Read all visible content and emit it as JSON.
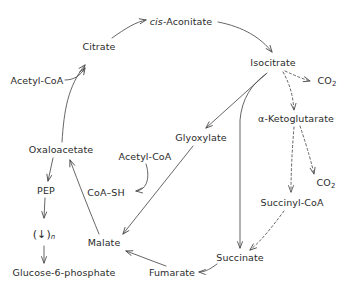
{
  "diagram": {
    "stroke_color": "#4a4a4a",
    "text_color": "#2b2b2b",
    "background_color": "#ffffff",
    "nodes": [
      {
        "id": "cis-aconitate",
        "label_prefix": "cis",
        "label": "-Aconitate",
        "x": 181,
        "y": 22
      },
      {
        "id": "citrate",
        "label": "Citrate",
        "x": 99,
        "y": 47
      },
      {
        "id": "isocitrate",
        "label": "Isocitrate",
        "x": 273,
        "y": 63
      },
      {
        "id": "acetyl-coa-top",
        "label": "Acetyl-CoA",
        "x": 37,
        "y": 81
      },
      {
        "id": "co2-top",
        "label": "CO",
        "sub": "2",
        "x": 327,
        "y": 82
      },
      {
        "id": "alpha-ketoglutarate",
        "label": "α-Ketoglutarate",
        "x": 296,
        "y": 119
      },
      {
        "id": "glyoxylate",
        "label": "Glyoxylate",
        "x": 201,
        "y": 138
      },
      {
        "id": "oxaloacetate",
        "label": "Oxaloacetate",
        "x": 61,
        "y": 150
      },
      {
        "id": "acetyl-coa-mid",
        "label": "Acetyl-CoA",
        "x": 145,
        "y": 157
      },
      {
        "id": "co2-bottom",
        "label": "CO",
        "sub": "2",
        "x": 326,
        "y": 184
      },
      {
        "id": "pep",
        "label": "PEP",
        "x": 46,
        "y": 191
      },
      {
        "id": "coa-sh",
        "label": "CoA–SH",
        "x": 106,
        "y": 193
      },
      {
        "id": "succinyl-coa",
        "label": "Succinyl-CoA",
        "x": 292,
        "y": 203
      },
      {
        "id": "repeat-steps",
        "label": "(↓)",
        "nsub": "n",
        "x": 44,
        "y": 235
      },
      {
        "id": "malate",
        "label": "Malate",
        "x": 104,
        "y": 243
      },
      {
        "id": "succinate",
        "label": "Succinate",
        "x": 240,
        "y": 258
      },
      {
        "id": "fumarate",
        "label": "Fumarate",
        "x": 172,
        "y": 273
      },
      {
        "id": "glucose-6-phosphate",
        "label": "Glucose-6-phosphate",
        "x": 64,
        "y": 273
      }
    ],
    "edges": [
      {
        "id": "citrate-to-cis-aconitate",
        "style": "solid",
        "from": "citrate",
        "to": "cis-aconitate"
      },
      {
        "id": "cis-aconitate-to-isocitrate",
        "style": "solid",
        "from": "cis-aconitate",
        "to": "isocitrate"
      },
      {
        "id": "oxaloacetate-to-citrate",
        "style": "solid",
        "from": "oxaloacetate",
        "to": "citrate"
      },
      {
        "id": "acetyl-coa-top-to-citrate",
        "style": "solid",
        "from": "acetyl-coa-top",
        "to": "citrate"
      },
      {
        "id": "isocitrate-to-co2",
        "style": "dashed",
        "from": "isocitrate",
        "to": "co2-top"
      },
      {
        "id": "isocitrate-to-alpha-ketoglutarate",
        "style": "dashed",
        "from": "isocitrate",
        "to": "alpha-ketoglutarate"
      },
      {
        "id": "alpha-ketoglutarate-to-co2",
        "style": "dashed",
        "from": "alpha-ketoglutarate",
        "to": "co2-bottom"
      },
      {
        "id": "alpha-ketoglutarate-to-succinyl-coa",
        "style": "dashed",
        "from": "alpha-ketoglutarate",
        "to": "succinyl-coa"
      },
      {
        "id": "succinyl-coa-to-succinate",
        "style": "dashed",
        "from": "succinyl-coa",
        "to": "succinate"
      },
      {
        "id": "isocitrate-to-glyoxylate",
        "style": "solid",
        "from": "isocitrate",
        "to": "glyoxylate"
      },
      {
        "id": "isocitrate-to-succinate",
        "style": "solid",
        "from": "isocitrate",
        "to": "succinate"
      },
      {
        "id": "glyoxylate-to-malate",
        "style": "solid",
        "from": "glyoxylate",
        "to": "malate"
      },
      {
        "id": "acetyl-coa-mid-to-coa-sh",
        "style": "solid",
        "from": "acetyl-coa-mid",
        "to": "coa-sh"
      },
      {
        "id": "succinate-to-fumarate",
        "style": "solid",
        "from": "succinate",
        "to": "fumarate"
      },
      {
        "id": "fumarate-to-malate",
        "style": "solid",
        "from": "fumarate",
        "to": "malate"
      },
      {
        "id": "malate-to-oxaloacetate",
        "style": "solid",
        "from": "malate",
        "to": "oxaloacetate"
      },
      {
        "id": "oxaloacetate-to-pep",
        "style": "solid",
        "from": "oxaloacetate",
        "to": "pep"
      },
      {
        "id": "pep-to-repeat-steps",
        "style": "solid",
        "from": "pep",
        "to": "repeat-steps"
      },
      {
        "id": "repeat-steps-to-glucose-6-phosphate",
        "style": "solid",
        "from": "repeat-steps",
        "to": "glucose-6-phosphate"
      }
    ]
  }
}
